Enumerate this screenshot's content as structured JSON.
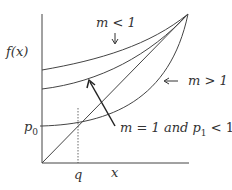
{
  "figure": {
    "ylabel": "f(x)",
    "xlabel": "x",
    "q_label": "q",
    "p0_label": "p",
    "p0_sub": "0",
    "curve_labels": {
      "m_lt_1": "m < 1",
      "m_gt_1": "m > 1",
      "m_eq_1_pre": "m = 1 and p",
      "m_eq_1_sub": "1",
      "m_eq_1_post": " < 1"
    },
    "colors": {
      "line": "#333333",
      "bg": "#ffffff"
    }
  }
}
